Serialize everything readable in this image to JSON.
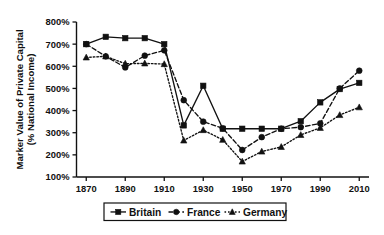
{
  "chart_data": {
    "type": "line",
    "title": "",
    "subtitle": "",
    "xlabel": "",
    "ylabel": "Marker Value of Private Capital\n(% National Income)",
    "ylabel_line1": "Marker Value of Private Capital",
    "ylabel_line2": "(% National Income)",
    "x": [
      1870,
      1880,
      1890,
      1900,
      1910,
      1920,
      1930,
      1940,
      1950,
      1960,
      1970,
      1980,
      1990,
      2000,
      2010
    ],
    "xtick_labels": [
      "1870",
      "1890",
      "1910",
      "1930",
      "1950",
      "1970",
      "1990",
      "2010"
    ],
    "xtick_values": [
      1870,
      1890,
      1910,
      1930,
      1950,
      1970,
      1990,
      2010
    ],
    "ytick_labels": [
      "100%",
      "200%",
      "300%",
      "400%",
      "500%",
      "600%",
      "700%",
      "800%"
    ],
    "ytick_values": [
      100,
      200,
      300,
      400,
      500,
      600,
      700,
      800
    ],
    "xlim": [
      1865,
      2015
    ],
    "ylim": [
      100,
      800
    ],
    "grid": false,
    "legend_position": "bottom",
    "series": [
      {
        "name": "Britain",
        "marker": "square",
        "line_style": "solid",
        "color": "#111111",
        "values": [
          700,
          733,
          727,
          727,
          700,
          333,
          512,
          318,
          318,
          318,
          318,
          352,
          437,
          497,
          525
        ]
      },
      {
        "name": "France",
        "marker": "circle",
        "line_style": "dashed",
        "color": "#111111",
        "values": [
          700,
          645,
          595,
          648,
          672,
          447,
          350,
          320,
          222,
          280,
          318,
          325,
          342,
          500,
          580
        ]
      },
      {
        "name": "Germany",
        "marker": "triangle",
        "line_style": "dotted",
        "color": "#111111",
        "values": [
          640,
          645,
          612,
          613,
          610,
          265,
          312,
          268,
          170,
          215,
          236,
          290,
          322,
          380,
          415
        ]
      }
    ]
  },
  "legend": {
    "items": [
      {
        "label": "Britain",
        "marker": "square",
        "line_style": "solid"
      },
      {
        "label": "France",
        "marker": "circle",
        "line_style": "dashed"
      },
      {
        "label": "Germany",
        "marker": "triangle",
        "line_style": "dotted"
      }
    ]
  },
  "colors": {
    "ink": "#111111",
    "background": "#ffffff"
  }
}
